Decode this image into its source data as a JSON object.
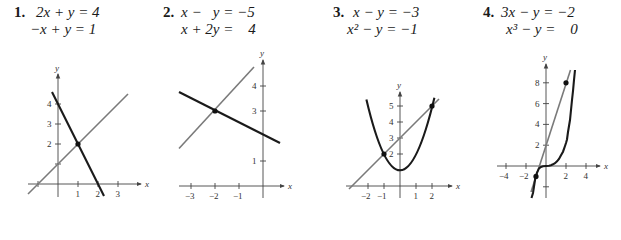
{
  "problems": [
    {
      "number": "1.",
      "equations": [
        "2x + y = 4",
        "−x + y = 1"
      ],
      "graph": {
        "x_tick_labels": [
          "1",
          "2",
          "3"
        ],
        "y_tick_labels": [
          "2",
          "3",
          "4"
        ],
        "x_axis_label": "x",
        "y_axis_label": "y",
        "intersections": [
          [
            1,
            2
          ]
        ]
      }
    },
    {
      "number": "2.",
      "equations": [
        "x −   y = −5",
        "x + 2y =    4"
      ],
      "graph": {
        "x_tick_labels": [
          "−3",
          "−2",
          "−1"
        ],
        "y_tick_labels": [
          "1",
          "3",
          "4"
        ],
        "x_axis_label": "x",
        "y_axis_label": "y",
        "intersections": [
          [
            -2,
            3
          ]
        ]
      }
    },
    {
      "number": "3.",
      "equations": [
        "x − y = −3",
        "x² − y = −1"
      ],
      "graph": {
        "x_tick_labels": [
          "−2",
          "−1",
          "1",
          "2"
        ],
        "y_tick_labels": [
          "2",
          "3",
          "4",
          "5"
        ],
        "x_axis_label": "x",
        "y_axis_label": "y",
        "intersections": [
          [
            -1,
            2
          ],
          [
            2,
            5
          ]
        ]
      }
    },
    {
      "number": "4.",
      "equations": [
        "3x − y = −2",
        "x³ − y =    0"
      ],
      "graph": {
        "x_tick_labels": [
          "−4",
          "−2",
          "2",
          "4"
        ],
        "y_tick_labels": [
          "2",
          "4",
          "6",
          "8"
        ],
        "x_axis_label": "x",
        "y_axis_label": "y",
        "intersections": [
          [
            -1,
            -1
          ],
          [
            2,
            8
          ]
        ]
      }
    }
  ],
  "colors": {
    "curve_primary": "#1a1a1a",
    "curve_secondary": "#7a7a7a"
  }
}
